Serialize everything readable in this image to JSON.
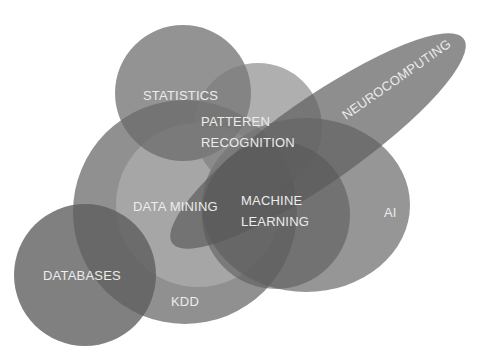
{
  "diagram": {
    "type": "venn-overlap",
    "fill_color": "#5a5a5a",
    "label_color": "#ececec",
    "sets": [
      {
        "id": "statistics",
        "label": "STATISTICS"
      },
      {
        "id": "pattern",
        "label_line1": "PATTEREN",
        "label_line2": "RECOGNITION"
      },
      {
        "id": "neurocomputing",
        "label": "NEUROCOMPUTING"
      },
      {
        "id": "kdd",
        "label": "KDD"
      },
      {
        "id": "datamining",
        "label": "DATA MINING"
      },
      {
        "id": "ml",
        "label_line1": "MACHINE",
        "label_line2": "LEARNING"
      },
      {
        "id": "ai",
        "label": "AI"
      },
      {
        "id": "databases",
        "label": "DATABASES"
      }
    ]
  }
}
